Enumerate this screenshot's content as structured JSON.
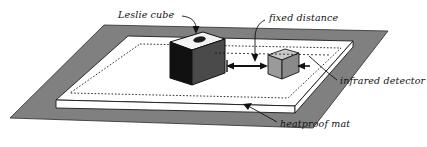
{
  "diagram": {
    "labels": {
      "leslie_cube": "Leslie cube",
      "fixed_distance": "fixed distance",
      "infrared_detector": "infrared detector",
      "heatproof_mat": "heatproof mat"
    },
    "objects": {
      "leslie_cube": {
        "name": "Leslie cube",
        "front_face_color": "#111111",
        "right_face_color": "#4a4a4a",
        "top_face_color": "#f2f2f2",
        "hole_color": "#1a1a1a",
        "hole_label": "filler hole"
      },
      "infrared_detector": {
        "name": "infrared detector",
        "front_face_color": "#9a9a9a",
        "right_face_color": "#8a8a8a",
        "top_face_color": "#c8c8c8"
      },
      "heatproof_mat": {
        "name": "heatproof mat",
        "top_color": "#ffffff",
        "edge_color": "#ffffff",
        "dotted_outline": "dotted inner rectangle"
      },
      "bench_surface": {
        "name": "bench surface",
        "color": "#808080"
      }
    },
    "annotations": {
      "fixed_distance_arrow": "double-headed horizontal arrow between Leslie cube and infrared detector",
      "leader_lines": 4
    },
    "colors": {
      "gray_surface": "#808080",
      "mat_white": "#ffffff",
      "cube_black": "#111111",
      "cube_dark_gray": "#4a4a4a",
      "cube_top": "#f2f2f2",
      "detector_gray": "#9a9a9a",
      "outline": "#1a1a1a",
      "text": "#111111"
    }
  }
}
